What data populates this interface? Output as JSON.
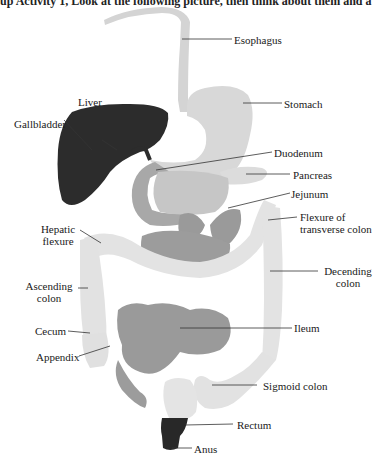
{
  "header": {
    "cut_off_text": "up Activity 1, Look at the following picture, then think about them and a"
  },
  "diagram": {
    "labels": {
      "esophagus": "Esophagus",
      "stomach": "Stomach",
      "liver": "Liver",
      "gallbladder": "Gallbladder",
      "duodenum": "Duodenum",
      "pancreas": "Pancreas",
      "jejunum": "Jejunum",
      "flexure_transverse_line1": "Flexure of",
      "flexure_transverse_line2": "transverse colon",
      "hepatic_line1": "Hepatic",
      "hepatic_line2": "flexure",
      "descending_line1": "Decending",
      "descending_line2": "colon",
      "ascending_line1": "Ascending",
      "ascending_line2": "colon",
      "cecum": "Cecum",
      "ileum": "Ileum",
      "appendix": "Appendix",
      "sigmoid": "Sigmoid colon",
      "rectum": "Rectum",
      "anus": "Anus"
    },
    "colors": {
      "liver": "#2b2b2b",
      "esophagus_stomach": "#d6d6d6",
      "small_intestine": "#9a9a9a",
      "large_intestine": "#e4e4e4",
      "pancreas": "#dedede",
      "rectum": "#2a2a2a",
      "leader_line": "#333333"
    }
  }
}
